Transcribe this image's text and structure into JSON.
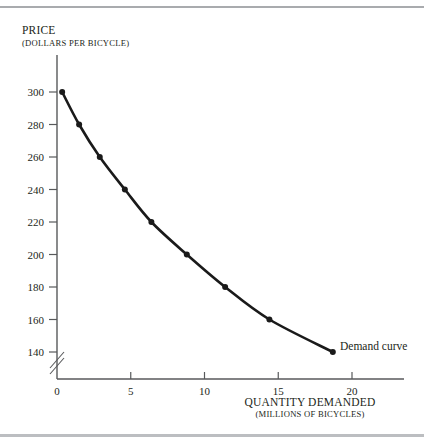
{
  "chart_data": {
    "type": "line",
    "title": "",
    "ylabel": "PRICE",
    "ylabel_sub": "(DOLLARS PER BICYCLE)",
    "xlabel": "QUANTITY DEMANDED",
    "xlabel_sub": "(MILLIONS OF BICYCLES)",
    "series_label": "Demand curve",
    "xlim": [
      0,
      21
    ],
    "ylim": [
      130,
      305
    ],
    "grid": false,
    "legend": "inline-annotation",
    "axis_break_y": true,
    "axis_break_x": false,
    "x_ticks": [
      0,
      5,
      10,
      15,
      20
    ],
    "y_ticks": [
      140,
      160,
      180,
      200,
      220,
      240,
      260,
      280,
      300
    ],
    "x": [
      0.35,
      1.5,
      2.9,
      4.6,
      6.4,
      8.8,
      11.4,
      14.4,
      18.7
    ],
    "values": [
      300,
      280,
      260,
      240,
      220,
      200,
      180,
      160,
      140
    ],
    "points": [
      {
        "quantity": 0.35,
        "price": 300
      },
      {
        "quantity": 1.5,
        "price": 280
      },
      {
        "quantity": 2.9,
        "price": 260
      },
      {
        "quantity": 4.6,
        "price": 240
      },
      {
        "quantity": 6.4,
        "price": 220
      },
      {
        "quantity": 8.8,
        "price": 200
      },
      {
        "quantity": 11.4,
        "price": 180
      },
      {
        "quantity": 14.4,
        "price": 160
      },
      {
        "quantity": 18.7,
        "price": 140
      }
    ],
    "colors": {
      "curve": "#1a1a1a",
      "axis": "#58595b",
      "rule": "#a9abae",
      "text": "#231f20"
    }
  }
}
